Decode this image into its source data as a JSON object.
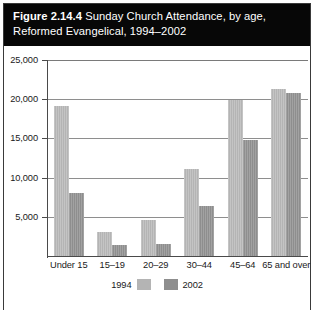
{
  "figure": {
    "number": "Figure 2.14.4",
    "title_rest": " Sunday Church Attendance, by age,",
    "title_line2": "Reformed Evangelical, 1994–2002"
  },
  "chart_data": {
    "type": "bar",
    "title": "Sunday Church Attendance, by age, Reformed Evangelical, 1994–2002",
    "xlabel": "",
    "ylabel": "",
    "ylim": [
      0,
      25000
    ],
    "grid": true,
    "legend_position": "bottom-center",
    "categories": [
      "Under 15",
      "15–19",
      "20–29",
      "30–44",
      "45–64",
      "65 and over"
    ],
    "ytick_labels": [
      "25,000",
      "20,000",
      "15,000",
      "10,000",
      "5,000"
    ],
    "ytick_values": [
      25000,
      20000,
      15000,
      10000,
      5000
    ],
    "series": [
      {
        "name": "1994",
        "color": "#b4b4b4",
        "values": [
          19100,
          3100,
          4600,
          11100,
          19900,
          21300
        ]
      },
      {
        "name": "2002",
        "color": "#8e8e8e",
        "values": [
          8000,
          1450,
          1500,
          6400,
          14800,
          20800
        ]
      }
    ]
  },
  "colors": {
    "title_band": "#070707",
    "title_text": "#ffffff",
    "frame": "#3a3a3a",
    "gridline": "#8e8e8e",
    "axis": "#4a4a4a",
    "series_1994": "#b4b4b4",
    "series_2002": "#8e8e8e"
  }
}
